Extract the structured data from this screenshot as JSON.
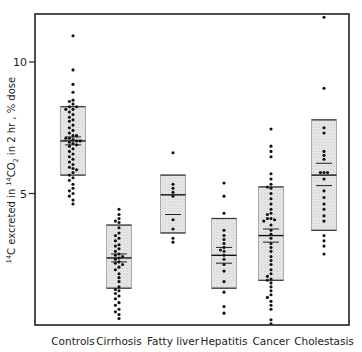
{
  "chart_data": {
    "type": "scatter",
    "subtype": "dot-plot with shaded range boxes",
    "title": "",
    "xlabel": "",
    "ylabel": "14C excreted in 14CO2 in 2 hr, % dose",
    "ylabel_parts": {
      "sup1": "14",
      "a": "C excreted in ",
      "sup2": "14",
      "b": "CO",
      "sub": "2",
      "c": " in 2 hr , % dose"
    },
    "ylim": [
      0,
      11.8
    ],
    "yticks": [
      5,
      10
    ],
    "ytick_labels": [
      "5",
      "10"
    ],
    "grid": false,
    "legend": null,
    "categories": [
      "Controls",
      "Cirrhosis",
      "Fatty liver",
      "Hepatitis",
      "Cancer",
      "Cholestasis"
    ],
    "groups": [
      {
        "name": "Controls",
        "x": 73,
        "box": {
          "low": 5.7,
          "high": 8.3
        },
        "mean": 7.0,
        "sem": [
          6.85,
          7.15
        ],
        "points": [
          11.0,
          9.7,
          9.15,
          8.85,
          8.55,
          8.5,
          8.4,
          8.3,
          8.3,
          8.2,
          8.2,
          8.1,
          8.0,
          7.9,
          7.8,
          7.75,
          7.6,
          7.5,
          7.4,
          7.3,
          7.2,
          7.2,
          7.1,
          7.1,
          7.05,
          7.0,
          7.0,
          6.95,
          6.9,
          6.85,
          6.8,
          6.7,
          6.6,
          6.5,
          6.4,
          6.3,
          6.2,
          6.1,
          6.0,
          5.95,
          5.9,
          5.8,
          5.7,
          5.6,
          5.5,
          5.35,
          5.2,
          5.1,
          5.0,
          4.9,
          4.75,
          4.6
        ]
      },
      {
        "name": "Cirrhosis",
        "x": 119,
        "box": {
          "low": 1.4,
          "high": 3.8
        },
        "mean": 2.55,
        "sem": [
          2.4,
          2.7
        ],
        "points": [
          4.4,
          4.2,
          4.05,
          3.95,
          3.9,
          3.7,
          3.5,
          3.4,
          3.3,
          3.2,
          3.05,
          3.0,
          2.9,
          2.8,
          2.7,
          2.65,
          2.6,
          2.55,
          2.5,
          2.4,
          2.35,
          2.3,
          2.2,
          2.1,
          1.95,
          1.8,
          1.65,
          1.45,
          1.35,
          1.3,
          1.2,
          1.1,
          1.0,
          0.85,
          0.75,
          0.6,
          0.5,
          0.4,
          0.25
        ]
      },
      {
        "name": "Fatty liver",
        "x": 173,
        "box": {
          "low": 3.5,
          "high": 5.7
        },
        "mean": 4.95,
        "sem": [
          4.2,
          4.95
        ],
        "points": [
          6.55,
          5.35,
          5.2,
          5.05,
          4.9,
          4.0,
          3.65,
          3.3,
          3.15
        ]
      },
      {
        "name": "Hepatitis",
        "x": 224,
        "box": {
          "low": 1.4,
          "high": 4.05
        },
        "mean": 2.65,
        "sem": [
          2.35,
          2.95
        ],
        "points": [
          5.4,
          4.9,
          4.25,
          3.6,
          3.4,
          3.25,
          3.1,
          2.95,
          2.85,
          2.8,
          2.65,
          2.5,
          2.3,
          2.05,
          1.65,
          1.25,
          0.7,
          0.45
        ]
      },
      {
        "name": "Cancer",
        "x": 271,
        "box": {
          "low": 1.7,
          "high": 5.25
        },
        "mean": 3.4,
        "sem": [
          3.15,
          3.65
        ],
        "points": [
          7.45,
          6.8,
          6.6,
          6.4,
          5.75,
          5.55,
          5.35,
          5.25,
          5.2,
          5.0,
          4.8,
          4.6,
          4.4,
          4.25,
          4.2,
          4.05,
          4.05,
          4.0,
          3.95,
          3.8,
          3.6,
          3.45,
          3.3,
          3.1,
          2.95,
          2.8,
          2.6,
          2.45,
          2.3,
          2.1,
          1.95,
          1.85,
          1.75,
          1.7,
          1.6,
          1.45,
          1.3,
          1.15,
          1.05,
          0.9,
          0.75,
          0.6,
          0.2,
          0.05
        ]
      },
      {
        "name": "Cholestasis",
        "x": 324,
        "box": {
          "low": 3.6,
          "high": 7.8
        },
        "mean": 5.7,
        "sem": [
          5.3,
          6.15
        ],
        "points": [
          11.7,
          9.0,
          7.5,
          7.3,
          6.6,
          6.45,
          6.3,
          5.8,
          5.8,
          5.8,
          5.55,
          5.1,
          4.85,
          4.6,
          4.4,
          4.15,
          3.95,
          3.4,
          3.2,
          3.0,
          2.7
        ]
      }
    ]
  },
  "axes": {
    "ytick_labels": [
      "5",
      "10"
    ],
    "category_labels": [
      "Controls",
      "Cirrhosis",
      "Fatty liver",
      "Hepatitis",
      "Cancer",
      "Cholestasis"
    ]
  }
}
